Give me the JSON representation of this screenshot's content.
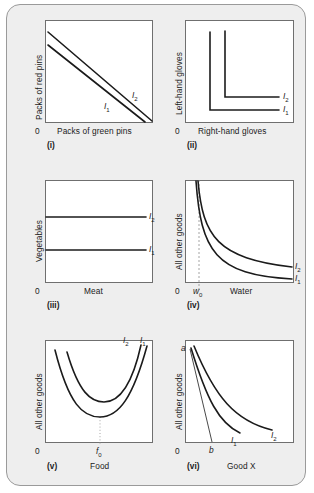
{
  "figure": {
    "background_color": "#eeeeee",
    "panel_background": "#ffffff",
    "line_color": "#1b1b1b"
  },
  "panels": [
    {
      "id": "i",
      "roman": "(i)",
      "origin": "0",
      "ylabel": "Packs of red pins",
      "xlabel": "Packs of green pins",
      "curve_type": "perfect-substitutes-straight-lines",
      "curves": [
        {
          "name": "I1",
          "label_main": "I",
          "label_sub": "1"
        },
        {
          "name": "I2",
          "label_main": "I",
          "label_sub": "2"
        }
      ]
    },
    {
      "id": "ii",
      "roman": "(ii)",
      "origin": "0",
      "ylabel": "Left-hand gloves",
      "xlabel": "Right-hand gloves",
      "curve_type": "perfect-complements-L-shapes",
      "curves": [
        {
          "name": "I1",
          "label_main": "I",
          "label_sub": "1"
        },
        {
          "name": "I2",
          "label_main": "I",
          "label_sub": "2"
        }
      ]
    },
    {
      "id": "iii",
      "roman": "(iii)",
      "origin": "0",
      "ylabel": "Vegetables",
      "xlabel": "Meat",
      "curve_type": "horizontal-lines",
      "curves": [
        {
          "name": "I1",
          "label_main": "I",
          "label_sub": "1"
        },
        {
          "name": "I2",
          "label_main": "I",
          "label_sub": "2"
        }
      ]
    },
    {
      "id": "iv",
      "roman": "(iv)",
      "origin": "0",
      "ylabel": "All other goods",
      "xlabel": "Water",
      "marker_label_main": "w",
      "marker_label_sub": "0",
      "curve_type": "convex-asymptotic",
      "curves": [
        {
          "name": "I1",
          "label_main": "I",
          "label_sub": "1"
        },
        {
          "name": "I2",
          "label_main": "I",
          "label_sub": "2"
        }
      ]
    },
    {
      "id": "v",
      "roman": "(v)",
      "origin": "0",
      "ylabel": "All other goods",
      "xlabel": "Food",
      "marker_label_main": "f",
      "marker_label_sub": "0",
      "curve_type": "u-shaped",
      "curves": [
        {
          "name": "I2",
          "label_main": "I",
          "label_sub": "2"
        },
        {
          "name": "I1",
          "label_main": "I",
          "label_sub": "1"
        }
      ]
    },
    {
      "id": "vi",
      "roman": "(vi)",
      "origin": "0",
      "ylabel": "All other goods",
      "xlabel": "Good X",
      "point_a": "a",
      "point_b": "b",
      "curve_type": "convex-with-budget-line",
      "curves": [
        {
          "name": "I1",
          "label_main": "I",
          "label_sub": "1"
        },
        {
          "name": "I2",
          "label_main": "I",
          "label_sub": "2"
        }
      ]
    }
  ]
}
